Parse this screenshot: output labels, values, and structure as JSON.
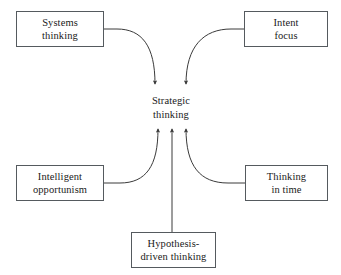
{
  "diagram": {
    "center": {
      "label": "Strategic\nthinking"
    },
    "nodes": [
      {
        "id": "systems-thinking",
        "label": "Systems\nthinking"
      },
      {
        "id": "intent-focus",
        "label": "Intent\nfocus"
      },
      {
        "id": "intelligent-opportunism",
        "label": "Intelligent\nopportunism"
      },
      {
        "id": "thinking-in-time",
        "label": "Thinking\nin time"
      },
      {
        "id": "hypothesis-driven",
        "label": "Hypothesis-\ndriven thinking"
      }
    ],
    "connectors": [
      {
        "from": "systems-thinking",
        "to": "center",
        "style": "curved",
        "arrow": "down"
      },
      {
        "from": "intent-focus",
        "to": "center",
        "style": "curved",
        "arrow": "down"
      },
      {
        "from": "intelligent-opportunism",
        "to": "center",
        "style": "curved",
        "arrow": "up"
      },
      {
        "from": "thinking-in-time",
        "to": "center",
        "style": "curved",
        "arrow": "up"
      },
      {
        "from": "hypothesis-driven",
        "to": "center",
        "style": "straight",
        "arrow": "up"
      }
    ],
    "colors": {
      "background": "#ffffff",
      "box_border": "#555a5e",
      "connector": "#3a3a3a",
      "text": "#1a1a1a"
    }
  }
}
